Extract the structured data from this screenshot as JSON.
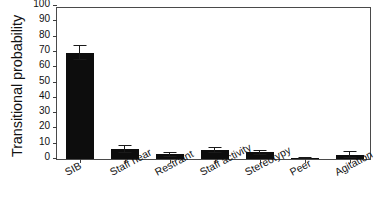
{
  "chart_data": {
    "type": "bar",
    "title": "",
    "xlabel": "",
    "ylabel": "Transitional probability",
    "ylim": [
      0,
      100
    ],
    "yticks": [
      0,
      10,
      20,
      30,
      40,
      50,
      60,
      70,
      80,
      90,
      100
    ],
    "ytick_labels": [
      "0",
      "10",
      "20",
      "30",
      "40",
      "50",
      "60",
      "70",
      "80",
      "90",
      "100"
    ],
    "grid": false,
    "legend": false,
    "bar_color": "#0d0d0d",
    "frame_color": "#4a4a4a",
    "background_color": "#ffffff",
    "categories": [
      "SIB",
      "Staff near",
      "Restraint",
      "Staff activity",
      "Stereotypy",
      "Peer",
      "Agitation"
    ],
    "values": [
      69.5,
      6.5,
      3.0,
      6.0,
      4.3,
      0.7,
      2.8
    ],
    "errors": [
      5.0,
      2.6,
      1.6,
      2.0,
      1.7,
      0.6,
      2.4
    ],
    "series": [
      {
        "name": "Transitional probability",
        "values": [
          69.5,
          6.5,
          3.0,
          6.0,
          4.3,
          0.7,
          2.8
        ],
        "errors": [
          5.0,
          2.6,
          1.6,
          2.0,
          1.7,
          0.6,
          2.4
        ]
      }
    ]
  }
}
